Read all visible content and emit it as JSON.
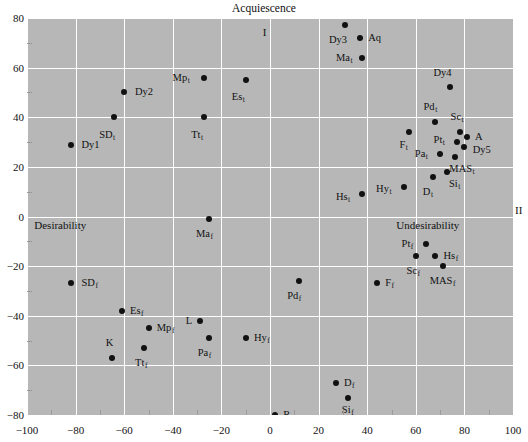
{
  "chart_data": {
    "type": "scatter",
    "title": "Acquiescence",
    "xlabel": "",
    "ylabel": "",
    "xlim": [
      -100,
      100
    ],
    "ylim": [
      -80,
      80
    ],
    "grid": true,
    "legend_position": "none",
    "xticks": [
      "-100",
      "-80",
      "-60",
      "-40",
      "-20",
      "0",
      "20",
      "40",
      "60",
      "80",
      "100"
    ],
    "xtick_values": [
      -100,
      -80,
      -60,
      -40,
      -20,
      0,
      20,
      40,
      60,
      80,
      100
    ],
    "yticks": [
      "80",
      "60",
      "40",
      "20",
      "0",
      "-20",
      "-40",
      "-60",
      "-80"
    ],
    "ytick_values": [
      80,
      60,
      40,
      20,
      0,
      -20,
      -40,
      -60,
      -80
    ],
    "annotations": [
      {
        "text": "I",
        "x": -3,
        "y": 74,
        "name": "quadrant-label-I"
      },
      {
        "text": "II",
        "x": 103,
        "y": 0,
        "name": "quadrant-label-II"
      },
      {
        "text": "Desirability",
        "x": -97,
        "y": -4,
        "name": "axis-pole-desirability"
      },
      {
        "text": "Undesirability",
        "x": 52,
        "y": -4,
        "name": "axis-pole-undesirability"
      }
    ],
    "points": [
      {
        "label": "Dy1",
        "sub": "",
        "x": -82,
        "y": 29,
        "lx": -78,
        "ly": 29,
        "anchor": "left"
      },
      {
        "label": "SD",
        "sub": "t",
        "x": -64,
        "y": 40,
        "lx": -67,
        "ly": 33,
        "anchor": "center"
      },
      {
        "label": "Dy2",
        "sub": "",
        "x": -60,
        "y": 50,
        "lx": -56,
        "ly": 50,
        "anchor": "left"
      },
      {
        "label": "Mp",
        "sub": "t",
        "x": -27,
        "y": 56,
        "lx": -33,
        "ly": 56,
        "anchor": "right"
      },
      {
        "label": "Tt",
        "sub": "t",
        "x": -27,
        "y": 40,
        "lx": -30,
        "ly": 33,
        "anchor": "center"
      },
      {
        "label": "Es",
        "sub": "t",
        "x": -10,
        "y": 55,
        "lx": -13,
        "ly": 48,
        "anchor": "center"
      },
      {
        "label": "Dy3",
        "sub": "",
        "x": 31,
        "y": 77,
        "lx": 28,
        "ly": 71,
        "anchor": "center"
      },
      {
        "label": "Aq",
        "sub": "",
        "x": 37,
        "y": 72,
        "lx": 40,
        "ly": 72,
        "anchor": "left"
      },
      {
        "label": "Ma",
        "sub": "t",
        "x": 38,
        "y": 64,
        "lx": 34,
        "ly": 64,
        "anchor": "right"
      },
      {
        "label": "Dy4",
        "sub": "",
        "x": 74,
        "y": 52,
        "lx": 71,
        "ly": 58,
        "anchor": "center"
      },
      {
        "label": "Pd",
        "sub": "t",
        "x": 68,
        "y": 38,
        "lx": 66,
        "ly": 44,
        "anchor": "center"
      },
      {
        "label": "Sc",
        "sub": "t",
        "x": 78,
        "y": 34,
        "lx": 77,
        "ly": 40,
        "anchor": "center"
      },
      {
        "label": "A",
        "sub": "",
        "x": 81,
        "y": 32,
        "lx": 84,
        "ly": 32,
        "anchor": "left"
      },
      {
        "label": "Pt",
        "sub": "t",
        "x": 77,
        "y": 30,
        "lx": 72,
        "ly": 31,
        "anchor": "right"
      },
      {
        "label": "Dy5",
        "sub": "",
        "x": 80,
        "y": 28,
        "lx": 83,
        "ly": 27,
        "anchor": "left"
      },
      {
        "label": "F",
        "sub": "t",
        "x": 57,
        "y": 34,
        "lx": 55,
        "ly": 29,
        "anchor": "center"
      },
      {
        "label": "Pa",
        "sub": "t",
        "x": 70,
        "y": 25,
        "lx": 65,
        "ly": 25,
        "anchor": "right"
      },
      {
        "label": "MAS",
        "sub": "t",
        "x": 76,
        "y": 24,
        "lx": 79,
        "ly": 19,
        "anchor": "center"
      },
      {
        "label": "Si",
        "sub": "t",
        "x": 73,
        "y": 18,
        "lx": 76,
        "ly": 13,
        "anchor": "center"
      },
      {
        "label": "D",
        "sub": "t",
        "x": 67,
        "y": 16,
        "lx": 65,
        "ly": 10,
        "anchor": "center"
      },
      {
        "label": "Hy",
        "sub": "t",
        "x": 55,
        "y": 12,
        "lx": 50,
        "ly": 11,
        "anchor": "right"
      },
      {
        "label": "Hs",
        "sub": "t",
        "x": 38,
        "y": 9,
        "lx": 33,
        "ly": 8,
        "anchor": "right"
      },
      {
        "label": "Ma",
        "sub": "f",
        "x": -25,
        "y": -1,
        "lx": -27,
        "ly": -7,
        "anchor": "center"
      },
      {
        "label": "Pt",
        "sub": "f",
        "x": 64,
        "y": -11,
        "lx": 59,
        "ly": -11,
        "anchor": "right"
      },
      {
        "label": "Hs",
        "sub": "f",
        "x": 68,
        "y": -16,
        "lx": 71,
        "ly": -16,
        "anchor": "left"
      },
      {
        "label": "Sc",
        "sub": "f",
        "x": 60,
        "y": -16,
        "lx": 59,
        "ly": -22,
        "anchor": "center"
      },
      {
        "label": "MAS",
        "sub": "f",
        "x": 71,
        "y": -20,
        "lx": 71,
        "ly": -26,
        "anchor": "center"
      },
      {
        "label": "F",
        "sub": "f",
        "x": 44,
        "y": -27,
        "lx": 47,
        "ly": -27,
        "anchor": "left"
      },
      {
        "label": "Pd",
        "sub": "f",
        "x": 12,
        "y": -26,
        "lx": 10,
        "ly": -32,
        "anchor": "center"
      },
      {
        "label": "SD",
        "sub": "f",
        "x": -82,
        "y": -27,
        "lx": -78,
        "ly": -27,
        "anchor": "left"
      },
      {
        "label": "Es",
        "sub": "f",
        "x": -61,
        "y": -38,
        "lx": -58,
        "ly": -38,
        "anchor": "left"
      },
      {
        "label": "Mp",
        "sub": "f",
        "x": -50,
        "y": -45,
        "lx": -47,
        "ly": -45,
        "anchor": "left"
      },
      {
        "label": "L",
        "sub": "",
        "x": -29,
        "y": -42,
        "lx": -32,
        "ly": -42,
        "anchor": "right"
      },
      {
        "label": "Pa",
        "sub": "f",
        "x": -25,
        "y": -49,
        "lx": -27,
        "ly": -55,
        "anchor": "center"
      },
      {
        "label": "Hy",
        "sub": "f",
        "x": -10,
        "y": -49,
        "lx": -7,
        "ly": -49,
        "anchor": "left"
      },
      {
        "label": "Tt",
        "sub": "f",
        "x": -52,
        "y": -53,
        "lx": -53,
        "ly": -59,
        "anchor": "center"
      },
      {
        "label": "K",
        "sub": "",
        "x": -65,
        "y": -57,
        "lx": -66,
        "ly": -51,
        "anchor": "center"
      },
      {
        "label": "D",
        "sub": "f",
        "x": 27,
        "y": -67,
        "lx": 30,
        "ly": -67,
        "anchor": "left"
      },
      {
        "label": "Si",
        "sub": "f",
        "x": 32,
        "y": -73,
        "lx": 32,
        "ly": -78,
        "anchor": "center"
      },
      {
        "label": "R",
        "sub": "",
        "x": 2,
        "y": -80,
        "lx": 5,
        "ly": -80,
        "anchor": "left"
      }
    ]
  }
}
